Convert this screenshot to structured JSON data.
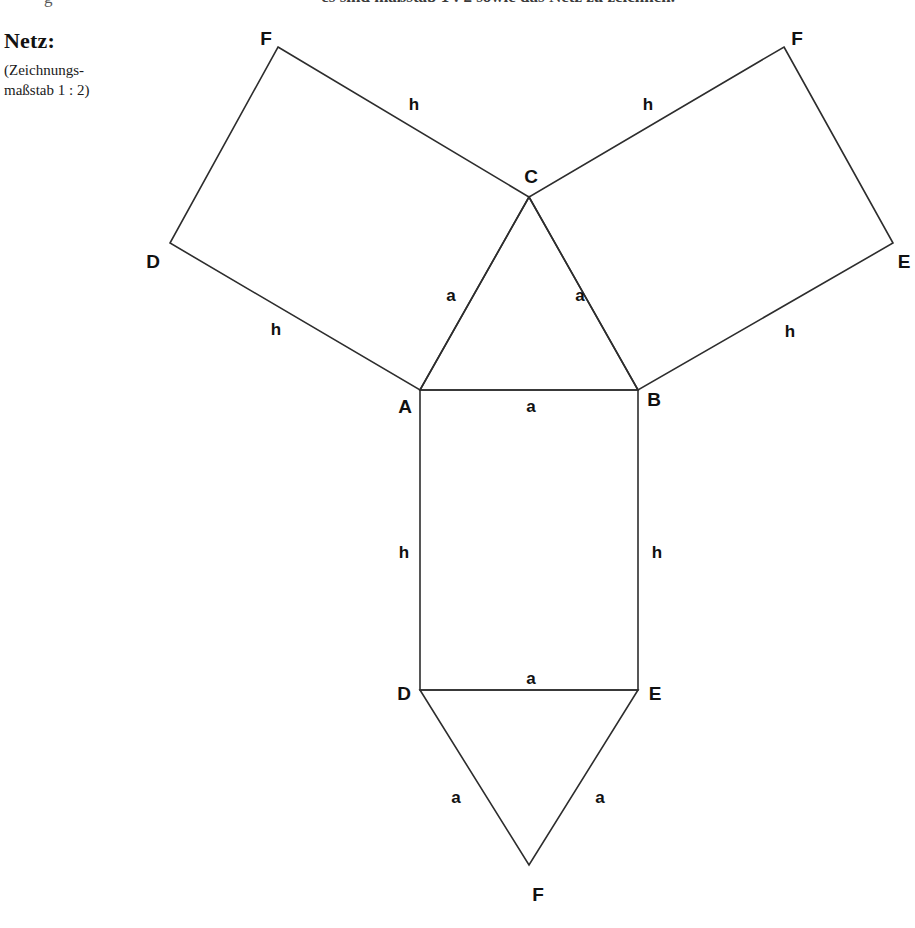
{
  "header": {
    "top_line_fragment": "— es sind maßstab 1 : 2 sowie das Netz zu zeichnen.",
    "top_line_stub": "g"
  },
  "caption": {
    "title": "Netz:",
    "note_line_1": "(Zeichnungs-",
    "note_line_2": "maßstab 1 : 2)"
  },
  "diagram": {
    "type": "net-of-triangular-prism",
    "stroke_color": "#2d2d2d",
    "background_color": "#ffffff",
    "canvas": {
      "width": 915,
      "height": 928
    },
    "vertices": {
      "top_left_F": {
        "x": 278,
        "y": 47,
        "label": "F"
      },
      "left_D": {
        "x": 170,
        "y": 243,
        "label": "D"
      },
      "top_right_F": {
        "x": 784,
        "y": 47,
        "label": "F"
      },
      "right_E": {
        "x": 893,
        "y": 243,
        "label": "E"
      },
      "C": {
        "x": 529,
        "y": 197,
        "label": "C"
      },
      "A": {
        "x": 420,
        "y": 390,
        "label": "A"
      },
      "B": {
        "x": 638,
        "y": 390,
        "label": "B"
      },
      "bottom_D": {
        "x": 420,
        "y": 690,
        "label": "D"
      },
      "bottom_E": {
        "x": 638,
        "y": 690,
        "label": "E"
      },
      "bottom_F": {
        "x": 529,
        "y": 865,
        "label": "F"
      }
    },
    "faces": [
      {
        "name": "left-rectangle",
        "points": "278,47 529,197 420,390 170,243"
      },
      {
        "name": "right-rectangle",
        "points": "784,47 893,243 638,390 529,197"
      },
      {
        "name": "top-triangle",
        "points": "420,390 638,390 529,197"
      },
      {
        "name": "middle-rectangle",
        "points": "420,390 638,390 638,690 420,690"
      },
      {
        "name": "bottom-triangle",
        "points": "420,690 638,690 529,865"
      }
    ],
    "vertex_labels": [
      {
        "name": "vertex-label-F-top-left",
        "text": "F",
        "x": 266,
        "y": 39
      },
      {
        "name": "vertex-label-D-left",
        "text": "D",
        "x": 153,
        "y": 262
      },
      {
        "name": "vertex-label-F-top-right",
        "text": "F",
        "x": 797,
        "y": 39
      },
      {
        "name": "vertex-label-E-right",
        "text": "E",
        "x": 904,
        "y": 262
      },
      {
        "name": "vertex-label-C",
        "text": "C",
        "x": 531,
        "y": 177
      },
      {
        "name": "vertex-label-A",
        "text": "A",
        "x": 405,
        "y": 407
      },
      {
        "name": "vertex-label-B",
        "text": "B",
        "x": 654,
        "y": 400
      },
      {
        "name": "vertex-label-D-bottom",
        "text": "D",
        "x": 404,
        "y": 694
      },
      {
        "name": "vertex-label-E-bottom",
        "text": "E",
        "x": 655,
        "y": 694
      },
      {
        "name": "vertex-label-F-bottom",
        "text": "F",
        "x": 538,
        "y": 895
      }
    ],
    "edge_labels": [
      {
        "name": "edge-label-h-top-left",
        "text": "h",
        "x": 414,
        "y": 105
      },
      {
        "name": "edge-label-h-top-right",
        "text": "h",
        "x": 648,
        "y": 105
      },
      {
        "name": "edge-label-h-lower-left",
        "text": "h",
        "x": 276,
        "y": 330
      },
      {
        "name": "edge-label-h-lower-right",
        "text": "h",
        "x": 790,
        "y": 332
      },
      {
        "name": "edge-label-a-triangle-left",
        "text": "a",
        "x": 451,
        "y": 296
      },
      {
        "name": "edge-label-a-triangle-right",
        "text": "a",
        "x": 580,
        "y": 296
      },
      {
        "name": "edge-label-a-AB",
        "text": "a",
        "x": 531,
        "y": 407
      },
      {
        "name": "edge-label-h-rect-left",
        "text": "h",
        "x": 404,
        "y": 553
      },
      {
        "name": "edge-label-h-rect-right",
        "text": "h",
        "x": 657,
        "y": 553
      },
      {
        "name": "edge-label-a-DE",
        "text": "a",
        "x": 531,
        "y": 679
      },
      {
        "name": "edge-label-a-bottom-left",
        "text": "a",
        "x": 456,
        "y": 798
      },
      {
        "name": "edge-label-a-bottom-right",
        "text": "a",
        "x": 600,
        "y": 798
      }
    ]
  }
}
